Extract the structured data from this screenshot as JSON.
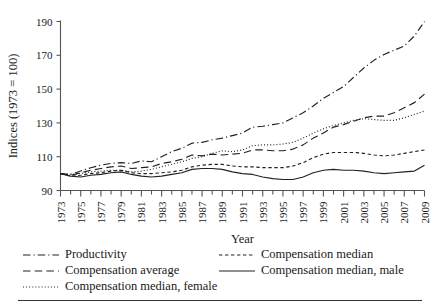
{
  "chart_data": {
    "type": "line",
    "title": "",
    "xlabel": "Year",
    "ylabel": "Indices (1973 = 100)",
    "xlim": [
      1973,
      2009
    ],
    "ylim": [
      90,
      190
    ],
    "yticks": [
      90,
      110,
      130,
      150,
      170,
      190
    ],
    "xticks": [
      1973,
      1975,
      1977,
      1979,
      1981,
      1983,
      1985,
      1987,
      1989,
      1991,
      1993,
      1995,
      1997,
      1999,
      2001,
      2003,
      2005,
      2007,
      2009
    ],
    "xtick_minor_every": 1,
    "grid": false,
    "legend_position": "below",
    "x": [
      1973,
      1974,
      1975,
      1976,
      1977,
      1978,
      1979,
      1980,
      1981,
      1982,
      1983,
      1984,
      1985,
      1986,
      1987,
      1988,
      1989,
      1990,
      1991,
      1992,
      1993,
      1994,
      1995,
      1996,
      1997,
      1998,
      1999,
      2000,
      2001,
      2002,
      2003,
      2004,
      2005,
      2006,
      2007,
      2008,
      2009
    ],
    "series": [
      {
        "name": "Productivity",
        "style": "dashdot",
        "values": [
          100,
          99.5,
          101.5,
          103.5,
          105,
          106,
          106.5,
          106,
          107.5,
          107,
          110,
          113,
          115,
          118,
          118.5,
          120,
          121,
          122.5,
          124,
          127.5,
          128,
          129,
          130,
          133,
          136,
          140,
          144.5,
          148,
          151.5,
          157,
          162.5,
          167,
          170.5,
          173,
          175.5,
          181.5,
          190
        ]
      },
      {
        "name": "Compensation average",
        "style": "dashed-long",
        "values": [
          100,
          99,
          100.5,
          102,
          103,
          104,
          104.5,
          103,
          103.5,
          104,
          106,
          107,
          108.5,
          111,
          110.5,
          111.5,
          111,
          111.5,
          112,
          114,
          114,
          113.5,
          113.5,
          114.5,
          117,
          121,
          124,
          127.5,
          129,
          131,
          133,
          134,
          134,
          136,
          139,
          142,
          147
        ]
      },
      {
        "name": "Compensation median, female",
        "style": "dotted",
        "values": [
          100,
          99.5,
          100,
          101,
          101.5,
          102,
          102,
          101,
          101.5,
          102.5,
          104,
          105.5,
          107,
          109,
          110,
          112,
          113.5,
          113,
          114,
          116.5,
          117,
          117,
          117.5,
          118.5,
          121,
          124,
          126.5,
          128.5,
          130,
          131.5,
          132.5,
          132,
          131.5,
          131.5,
          133,
          135,
          137
        ]
      },
      {
        "name": "Compensation median",
        "style": "dashed-short",
        "values": [
          100,
          98.5,
          99,
          100,
          100.5,
          101.5,
          102,
          100.5,
          100,
          100,
          100.5,
          101,
          102,
          104,
          105,
          105.5,
          105.5,
          104.5,
          104,
          104,
          103.5,
          103.5,
          103.5,
          104.5,
          106.5,
          109.5,
          111.5,
          112.5,
          112.5,
          112.5,
          112,
          111,
          110.5,
          111,
          112,
          113,
          114
        ]
      },
      {
        "name": "Compensation median, male",
        "style": "solid",
        "values": [
          100,
          98.5,
          98,
          99,
          99.5,
          100.5,
          101,
          99.5,
          98.5,
          98,
          98.5,
          99.5,
          100.5,
          102.5,
          103,
          103,
          102.5,
          101,
          100,
          99.5,
          98,
          97,
          96.5,
          96.5,
          98,
          100.5,
          102,
          102.5,
          102,
          102,
          101.5,
          100.5,
          100,
          100.5,
          101,
          101.5,
          105
        ]
      }
    ]
  },
  "legend": {
    "items": [
      {
        "label": "Productivity",
        "style": "dashdot",
        "column": "left"
      },
      {
        "label": "Compensation average",
        "style": "dashed-long",
        "column": "left"
      },
      {
        "label": "Compensation median, female",
        "style": "dotted",
        "column": "left"
      },
      {
        "label": "Compensation median",
        "style": "dashed-short",
        "column": "right"
      },
      {
        "label": "Compensation median, male",
        "style": "solid",
        "column": "right"
      }
    ]
  },
  "colors": {
    "line": "#222222",
    "axis": "#555555",
    "text": "#1a1a1a"
  }
}
